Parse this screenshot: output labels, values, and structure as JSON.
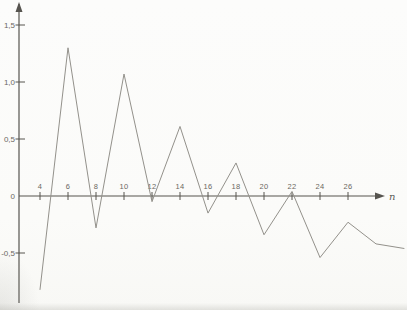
{
  "figure": {
    "background": "#fbfbf9",
    "axis_color": "#56544f",
    "curve_color": "#93918b",
    "label_color": "#6b6862",
    "x_axis_label": "n"
  },
  "chart_data": {
    "type": "line",
    "title": "",
    "xlabel": "n",
    "ylabel": "",
    "x": [
      4,
      6,
      8,
      10,
      12,
      14,
      16,
      18,
      20,
      22,
      24,
      26,
      28,
      30
    ],
    "values": [
      -0.82,
      1.3,
      -0.28,
      1.07,
      -0.05,
      0.61,
      -0.15,
      0.29,
      -0.34,
      0.04,
      -0.54,
      -0.23,
      -0.42,
      -0.46
    ],
    "x_ticks": [
      4,
      6,
      8,
      10,
      12,
      14,
      16,
      18,
      20,
      22,
      24,
      26
    ],
    "x_tick_labels": [
      "4",
      "6",
      "8",
      "10",
      "12",
      "14",
      "16",
      "18",
      "20",
      "22",
      "24",
      "26"
    ],
    "y_tick_values": [
      1.5,
      1.0,
      0.5,
      0,
      -0.5
    ],
    "y_tick_labels": [
      "1,5",
      "1,0",
      "0,5",
      "0",
      "-0,5"
    ],
    "xlim": [
      2.5,
      30.2
    ],
    "ylim": [
      -1.0,
      1.68
    ],
    "grid": false,
    "legend": null
  }
}
